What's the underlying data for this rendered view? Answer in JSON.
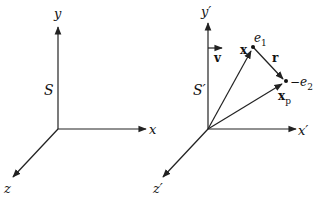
{
  "figure": {
    "left_frame": {
      "name": "S",
      "axes": {
        "x": "x",
        "y": "y",
        "z": "z"
      }
    },
    "right_frame": {
      "name": "S′",
      "axes": {
        "x": "x′",
        "y": "y′",
        "z": "z′"
      },
      "velocity_label": "v",
      "position_vector_label": "x",
      "particle_position_label": "x",
      "particle_position_sub": "p",
      "separation_label": "r",
      "charge1_label": "e",
      "charge1_sub": "1",
      "charge2_label": "−e",
      "charge2_sub": "2"
    }
  }
}
